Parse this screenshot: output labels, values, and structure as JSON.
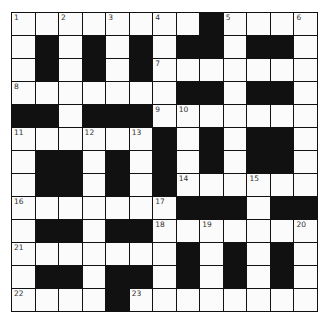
{
  "puzzle": {
    "type": "crossword",
    "size": {
      "rows": 13,
      "cols": 13
    },
    "colors": {
      "black": "#111111",
      "white": "#fbfbfb",
      "numbers": "#333333"
    },
    "grid": [
      "WWWWWWWWBWWWW",
      "WBWBWBWBBWBBW",
      "WBWBWBWWWWWWW",
      "WWWWWWWBBWBBW",
      "BBWBBBWWWWWWW",
      "WWWWWWBWBWBBW",
      "WBBWBWBWBWBBW",
      "WBBWBWBWWWWWW",
      "WWWWWWWBBBWBB",
      "WBBWBBWWWWWWW",
      "WWWWWWWBWBWBW",
      "WBBWBBWBWBWBW",
      "WWWWBWWWWWWWW"
    ],
    "numbers": [
      {
        "r": 0,
        "c": 0,
        "n": "1"
      },
      {
        "r": 0,
        "c": 2,
        "n": "2"
      },
      {
        "r": 0,
        "c": 4,
        "n": "3"
      },
      {
        "r": 0,
        "c": 6,
        "n": "4"
      },
      {
        "r": 0,
        "c": 9,
        "n": "5"
      },
      {
        "r": 0,
        "c": 12,
        "n": "6"
      },
      {
        "r": 2,
        "c": 6,
        "n": "7"
      },
      {
        "r": 3,
        "c": 0,
        "n": "8"
      },
      {
        "r": 4,
        "c": 6,
        "n": "9"
      },
      {
        "r": 4,
        "c": 7,
        "n": "10"
      },
      {
        "r": 5,
        "c": 0,
        "n": "11"
      },
      {
        "r": 5,
        "c": 3,
        "n": "12"
      },
      {
        "r": 5,
        "c": 5,
        "n": "13"
      },
      {
        "r": 7,
        "c": 7,
        "n": "14"
      },
      {
        "r": 7,
        "c": 10,
        "n": "15"
      },
      {
        "r": 8,
        "c": 0,
        "n": "16"
      },
      {
        "r": 8,
        "c": 6,
        "n": "17"
      },
      {
        "r": 9,
        "c": 6,
        "n": "18"
      },
      {
        "r": 9,
        "c": 8,
        "n": "19"
      },
      {
        "r": 9,
        "c": 12,
        "n": "20"
      },
      {
        "r": 10,
        "c": 0,
        "n": "21"
      },
      {
        "r": 12,
        "c": 0,
        "n": "22"
      },
      {
        "r": 12,
        "c": 5,
        "n": "23"
      }
    ]
  }
}
